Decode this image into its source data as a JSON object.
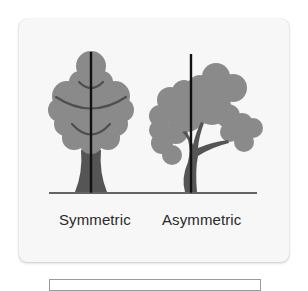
{
  "figure": {
    "labels": {
      "symmetric": "Symmetric",
      "asymmetric": "Asymmetric"
    },
    "colors": {
      "card_background": "#f7f7f7",
      "foliage": "#8a8a8a",
      "branch": "#4e4e4e",
      "trunk": "#555555",
      "axis_line": "#111111",
      "ground_line": "#333333"
    }
  }
}
